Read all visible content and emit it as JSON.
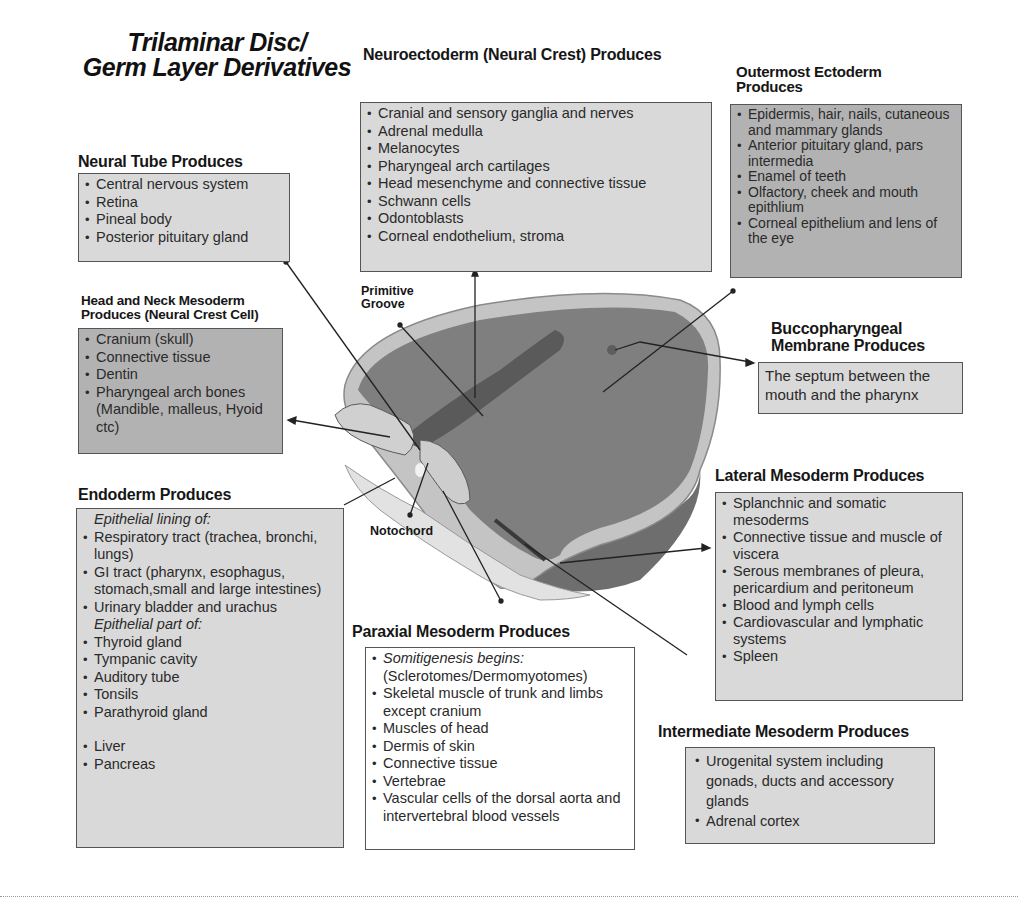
{
  "title": {
    "line1": "Trilaminar Disc/",
    "line2": "Germ Layer Derivatives"
  },
  "neural_tube": {
    "heading": "Neural Tube Produces",
    "items": [
      "Central nervous system",
      "Retina",
      "Pineal body",
      "Posterior pituitary gland"
    ]
  },
  "neuroectoderm": {
    "heading": "Neuroectoderm (Neural Crest) Produces",
    "items": [
      "Cranial and sensory ganglia and nerves",
      "Adrenal medulla",
      "Melanocytes",
      "Pharyngeal arch cartilages",
      "Head mesenchyme and connective tissue",
      "Schwann cells",
      "Odontoblasts",
      "Corneal endothelium, stroma"
    ]
  },
  "outermost_ectoderm": {
    "heading_line1": "Outermost Ectoderm",
    "heading_line2": "Produces",
    "items": [
      "Epidermis, hair, nails, cutaneous and mammary glands",
      "Anterior pituitary gland, pars intermedia",
      "Enamel of teeth",
      "Olfactory, cheek and mouth epithlium",
      "Corneal epithelium and lens of the eye"
    ]
  },
  "head_neck_mesoderm": {
    "heading_line1": "Head and Neck Mesoderm",
    "heading_line2": "Produces (Neural Crest Cell)",
    "items": [
      "Cranium (skull)",
      "Connective tissue",
      "Dentin",
      "Pharyngeal arch bones (Mandible, malleus, Hyoid ctc)"
    ]
  },
  "buccopharyngeal": {
    "heading_line1": "Buccopharyngeal",
    "heading_line2": "Membrane Produces",
    "text": "The septum between the mouth and the pharynx"
  },
  "endoderm": {
    "heading": "Endoderm Produces",
    "sub1": "Epithelial lining of:",
    "items1": [
      "Respiratory tract (trachea, bronchi, lungs)",
      "GI tract (pharynx, esophagus, stomach,small and large intestines)",
      "Urinary bladder and urachus"
    ],
    "sub2": "Epithelial part of:",
    "items2": [
      "Thyroid gland",
      "Tympanic cavity",
      "Auditory tube",
      "Tonsils",
      "Parathyroid gland"
    ],
    "items3": [
      "Liver",
      "Pancreas"
    ]
  },
  "lateral_mesoderm": {
    "heading": "Lateral Mesoderm Produces",
    "items": [
      "Splanchnic and somatic mesoderms",
      "Connective tissue and muscle of viscera",
      "Serous membranes of pleura, pericardium  and peritoneum",
      "Blood and lymph cells",
      "Cardiovascular and lymphatic systems",
      "Spleen"
    ]
  },
  "paraxial_mesoderm": {
    "heading": "Paraxial Mesoderm Produces",
    "first_italic": "Somitigenesis begins:",
    "first_rest": "(Sclerotomes/Dermomyotomes)",
    "items": [
      "Skeletal muscle of trunk and limbs except cranium",
      "Muscles of head",
      "Dermis of skin",
      "Connective tissue",
      "Vertebrae",
      "Vascular cells of the dorsal aorta and intervertebral blood vessels"
    ]
  },
  "intermediate_mesoderm": {
    "heading": "Intermediate Mesoderm Produces",
    "items": [
      "Urogenital system including gonads, ducts and accessory glands",
      "Adrenal cortex"
    ]
  },
  "diagram_labels": {
    "primitive_groove_line1": "Primitive",
    "primitive_groove_line2": "Groove",
    "notochord": "Notochord"
  },
  "colors": {
    "box_light": "#d9d9d9",
    "box_dark": "#b2b2b2",
    "disc_fill": "#7d7d7d",
    "disc_rim": "#bdbdbd"
  }
}
